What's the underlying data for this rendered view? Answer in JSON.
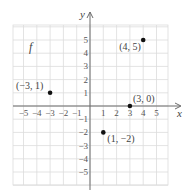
{
  "chart_data": {
    "type": "scatter",
    "title": "",
    "function_label": "f",
    "xlabel": "x",
    "ylabel": "y",
    "xlim": [
      -5.8,
      5.8
    ],
    "ylim": [
      -5.8,
      6
    ],
    "grid": true,
    "x_ticks": [
      -5,
      -4,
      -3,
      -2,
      -1,
      1,
      2,
      3,
      4,
      5
    ],
    "y_ticks": [
      -5,
      -4,
      -3,
      -2,
      -1,
      1,
      2,
      3,
      4,
      5
    ],
    "x_tick_labels": [
      "−5",
      "−4",
      "−3",
      "−2",
      "−1",
      "1",
      "2",
      "3",
      "4",
      "5"
    ],
    "y_tick_labels": [
      "−5",
      "−4",
      "−3",
      "−2",
      "−1",
      "1",
      "2",
      "3",
      "4",
      "5"
    ],
    "points": [
      {
        "x": -3,
        "y": 1,
        "label": "(−3, 1)"
      },
      {
        "x": 1,
        "y": -2,
        "label": "(1, −2)"
      },
      {
        "x": 3,
        "y": 0,
        "label": "(3, 0)"
      },
      {
        "x": 4,
        "y": 5,
        "label": "(4, 5)"
      }
    ]
  },
  "colors": {
    "grid": "#dcdcdc",
    "axis": "#6b6b6b",
    "point": "#111111",
    "text": "#444444"
  }
}
